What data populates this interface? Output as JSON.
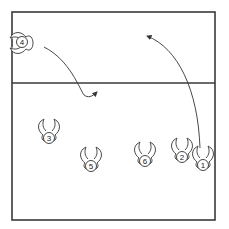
{
  "diagram": {
    "type": "volleyball-rotation",
    "court": {
      "left": 12,
      "right": 215,
      "top": 12,
      "net_y": 83,
      "bottom": 220,
      "line_color": "#3a3a3a"
    },
    "players": [
      {
        "number": "1",
        "x": 203,
        "y": 165
      },
      {
        "number": "2",
        "x": 182,
        "y": 157
      },
      {
        "number": "3",
        "x": 49,
        "y": 138
      },
      {
        "number": "4",
        "x": 22,
        "y": 42
      },
      {
        "number": "5",
        "x": 91,
        "y": 166
      },
      {
        "number": "6",
        "x": 145,
        "y": 161
      }
    ],
    "arrows": [
      {
        "from": "player-4",
        "description": "curved path from player 4 down to back court",
        "path": "M44,47 C70,60 80,90 84,95 C88,98 92,97 97,92"
      },
      {
        "from": "player-1",
        "description": "curved path from player 1 up to front court",
        "path": "M200,148 C198,90 178,48 147,36"
      }
    ]
  }
}
